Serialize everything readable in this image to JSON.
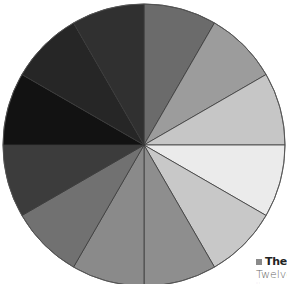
{
  "diagram": {
    "type": "grayscale-wheel",
    "center": [
      144,
      145
    ],
    "radius": 141,
    "segment_count": 12,
    "start_angle_deg": 0,
    "direction": "clockwise-from-top",
    "stroke": "#3a3a3a",
    "segments": [
      {
        "index": 1,
        "from_deg": 0,
        "to_deg": 30,
        "color": "#6b6b6b"
      },
      {
        "index": 2,
        "from_deg": 30,
        "to_deg": 60,
        "color": "#9c9c9c"
      },
      {
        "index": 3,
        "from_deg": 60,
        "to_deg": 90,
        "color": "#c6c6c6"
      },
      {
        "index": 4,
        "from_deg": 90,
        "to_deg": 120,
        "color": "#ebebeb"
      },
      {
        "index": 5,
        "from_deg": 120,
        "to_deg": 150,
        "color": "#c8c8c8"
      },
      {
        "index": 6,
        "from_deg": 150,
        "to_deg": 180,
        "color": "#8e8e8e"
      },
      {
        "index": 7,
        "from_deg": 180,
        "to_deg": 210,
        "color": "#8a8a8a"
      },
      {
        "index": 8,
        "from_deg": 210,
        "to_deg": 240,
        "color": "#717171"
      },
      {
        "index": 9,
        "from_deg": 240,
        "to_deg": 270,
        "color": "#3c3c3c"
      },
      {
        "index": 10,
        "from_deg": 270,
        "to_deg": 300,
        "color": "#121212"
      },
      {
        "index": 11,
        "from_deg": 300,
        "to_deg": 330,
        "color": "#262626"
      },
      {
        "index": 12,
        "from_deg": 330,
        "to_deg": 360,
        "color": "#303030"
      }
    ]
  },
  "caption": {
    "marker_color": "#8a8a8a",
    "title": "The c",
    "body": "Twelve",
    "small": "·· ·"
  }
}
